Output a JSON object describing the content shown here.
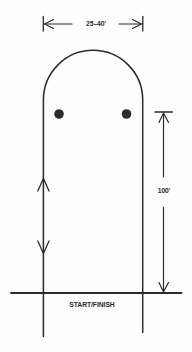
{
  "diagram": {
    "type": "course-pattern",
    "dimensions": {
      "width_label": "25–40'",
      "length_label": "100'"
    },
    "start_finish_label": "START/FINISH",
    "markers": {
      "count": 2,
      "shape": "filled-dot"
    },
    "direction_arrows": [
      "up-arrow",
      "down-arrow"
    ],
    "colors": {
      "ink": "#2b2b2b",
      "background": "#fdfdfd"
    }
  }
}
